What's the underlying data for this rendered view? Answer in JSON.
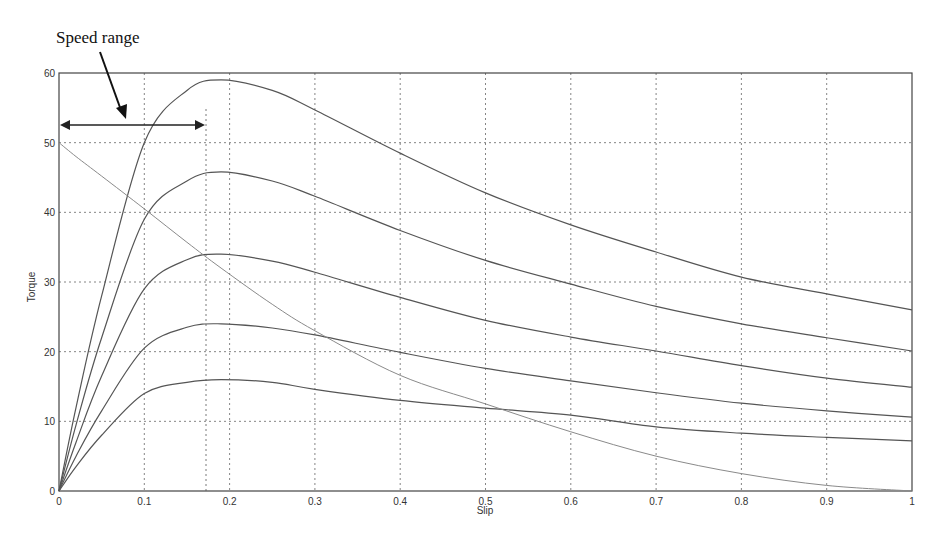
{
  "chart_data": {
    "type": "line",
    "title": "",
    "xlabel": "Slip",
    "ylabel": "Torque",
    "xlim": [
      0,
      1
    ],
    "ylim": [
      0,
      60
    ],
    "grid": true,
    "x_ticks": [
      "0",
      "0.1",
      "0.2",
      "0.3",
      "0.4",
      "0.5",
      "0.6",
      "0.7",
      "0.8",
      "0.9",
      "1"
    ],
    "y_ticks": [
      "0",
      "10",
      "20",
      "30",
      "40",
      "50",
      "60"
    ],
    "x": [
      0,
      0.02,
      0.05,
      0.1,
      0.15,
      0.19,
      0.25,
      0.3,
      0.4,
      0.5,
      0.6,
      0.7,
      0.8,
      0.9,
      1.0
    ],
    "series": [
      {
        "name": "Torque curve 1",
        "values": [
          0,
          12,
          28,
          50,
          57.5,
          59,
          57.5,
          54.7,
          48.5,
          42.8,
          38.2,
          34.3,
          30.7,
          28.3,
          26
        ]
      },
      {
        "name": "Torque curve 2",
        "values": [
          0,
          9.5,
          22,
          39,
          44.5,
          45.8,
          44.5,
          42.3,
          37.4,
          33.1,
          29.7,
          26.5,
          24,
          22,
          20.1
        ]
      },
      {
        "name": "Torque curve 3",
        "values": [
          0,
          7,
          16.5,
          29,
          33.2,
          34,
          33,
          31.4,
          27.8,
          24.5,
          22.1,
          20.1,
          18,
          16.2,
          14.9
        ]
      },
      {
        "name": "Torque curve 4",
        "values": [
          0,
          5,
          11.5,
          20.5,
          23.5,
          24,
          23.4,
          22.4,
          19.9,
          17.6,
          15.8,
          14.1,
          12.6,
          11.5,
          10.6
        ]
      },
      {
        "name": "Torque curve 5",
        "values": [
          0,
          3.5,
          8,
          14,
          15.6,
          16,
          15.6,
          14.6,
          13,
          11.9,
          10.9,
          9.2,
          8.3,
          7.7,
          7.2
        ]
      },
      {
        "name": "Load torque",
        "values": [
          50,
          48,
          45.2,
          40.5,
          35.7,
          32,
          26.8,
          23,
          16.6,
          12.5,
          8.5,
          5,
          2.5,
          0.8,
          0
        ]
      }
    ],
    "annotations": [
      {
        "text": "Speed range",
        "arrow_span_x": [
          0,
          0.172
        ],
        "arrow_y": 52.5,
        "marker_x": 0.172
      }
    ],
    "legend": "none"
  },
  "annotation": {
    "label": "Speed range"
  }
}
